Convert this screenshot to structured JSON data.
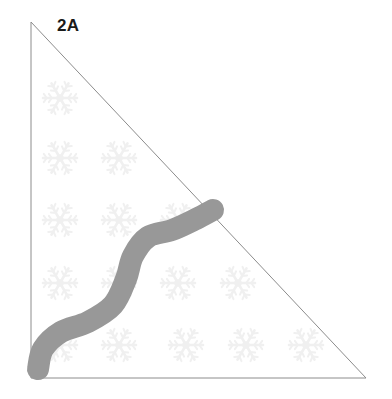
{
  "figure": {
    "panel_label": "2A",
    "background_color": "#ffffff",
    "canvas": {
      "width": 392,
      "height": 399
    }
  },
  "triangle": {
    "name": "right-triangle-outline",
    "stroke_color": "#8c8c8c",
    "stroke_width": 1,
    "fill_color": "#ffffff",
    "vertices": [
      {
        "label": "top-left",
        "x": 31,
        "y": 22
      },
      {
        "label": "bottom-right",
        "x": 366,
        "y": 378
      },
      {
        "label": "bottom-left",
        "x": 31,
        "y": 378
      }
    ]
  },
  "path_curve": {
    "name": "wavy-path",
    "color": "#989898",
    "stroke_width": 22,
    "linecap": "round",
    "description": "thick gray S-shaped wavy path from bottom-left vertex up to the hypotenuse",
    "points": [
      {
        "x": 38,
        "y": 369
      },
      {
        "x": 43,
        "y": 349
      },
      {
        "x": 61,
        "y": 332
      },
      {
        "x": 88,
        "y": 322
      },
      {
        "x": 113,
        "y": 305
      },
      {
        "x": 126,
        "y": 279
      },
      {
        "x": 133,
        "y": 256
      },
      {
        "x": 148,
        "y": 237
      },
      {
        "x": 172,
        "y": 230
      },
      {
        "x": 196,
        "y": 219
      },
      {
        "x": 213,
        "y": 210
      }
    ],
    "start_point": {
      "x": 38,
      "y": 369
    },
    "end_point": {
      "x": 213,
      "y": 210
    }
  },
  "snowflakes": {
    "name": "snowflake-watermark-grid",
    "color": "#f0f0f0",
    "radius": 17,
    "count": 15,
    "positions": [
      {
        "x": 60,
        "y": 98
      },
      {
        "x": 60,
        "y": 158
      },
      {
        "x": 119,
        "y": 158
      },
      {
        "x": 60,
        "y": 220
      },
      {
        "x": 119,
        "y": 220
      },
      {
        "x": 178,
        "y": 220
      },
      {
        "x": 60,
        "y": 283
      },
      {
        "x": 119,
        "y": 283
      },
      {
        "x": 178,
        "y": 283
      },
      {
        "x": 238,
        "y": 283
      },
      {
        "x": 60,
        "y": 345
      },
      {
        "x": 119,
        "y": 345
      },
      {
        "x": 186,
        "y": 345
      },
      {
        "x": 246,
        "y": 345
      },
      {
        "x": 306,
        "y": 345
      }
    ]
  }
}
